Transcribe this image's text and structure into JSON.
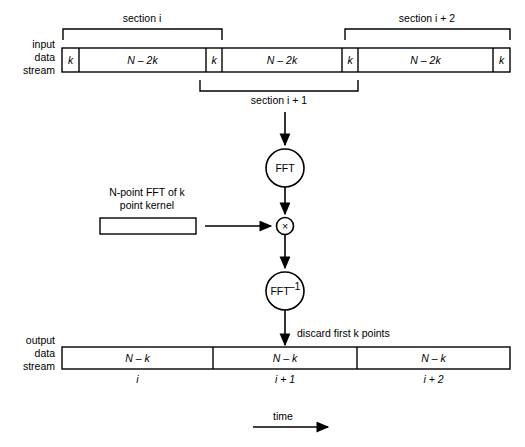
{
  "diagram": {
    "colors": {
      "ink": "#000000",
      "paper": "#ffffff"
    },
    "input_stream": {
      "label_lines": [
        "input",
        "data",
        "stream"
      ],
      "cells": [
        {
          "text": "k",
          "kind": "overlap"
        },
        {
          "text": "N – 2k",
          "kind": "body"
        },
        {
          "text": "k",
          "kind": "overlap"
        },
        {
          "text": "N – 2k",
          "kind": "body"
        },
        {
          "text": "k",
          "kind": "overlap"
        },
        {
          "text": "N – 2k",
          "kind": "body"
        },
        {
          "text": "k",
          "kind": "overlap"
        }
      ]
    },
    "brackets": [
      {
        "name": "section-i",
        "label": "section i",
        "position": "above"
      },
      {
        "name": "section-i-plus-1",
        "label": "section i + 1",
        "position": "below"
      },
      {
        "name": "section-i-plus-2",
        "label": "section i + 2",
        "position": "above"
      }
    ],
    "nodes": {
      "fft": "FFT",
      "multiply": "×",
      "ifft_base": "FFT",
      "ifft_exponent": "–1"
    },
    "kernel": {
      "caption_line1": "N-point FFT of k",
      "caption_line2": "point kernel"
    },
    "annotations": {
      "discard": "discard first k points",
      "time": "time"
    },
    "output_stream": {
      "label_lines": [
        "output",
        "data",
        "stream"
      ],
      "cells": [
        {
          "text": "N – k",
          "index_label": "i"
        },
        {
          "text": "N – k",
          "index_label": "i + 1"
        },
        {
          "text": "N – k",
          "index_label": "i + 2"
        }
      ]
    }
  }
}
